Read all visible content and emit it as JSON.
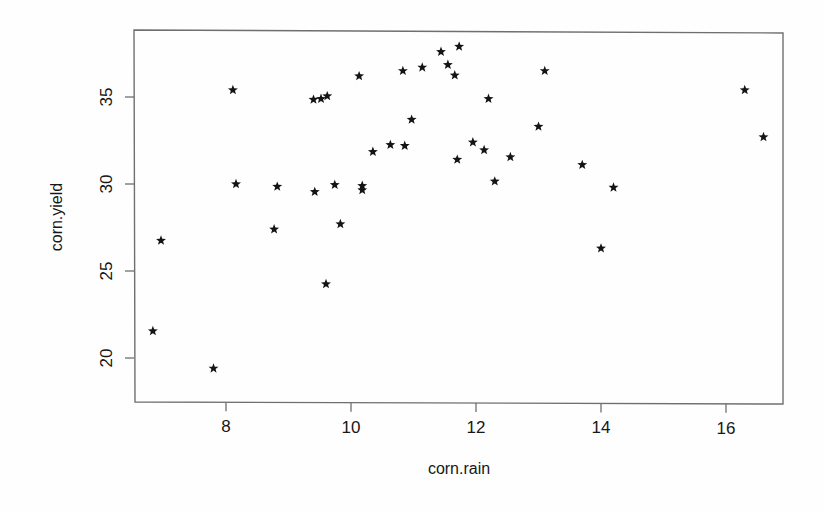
{
  "chart_data": {
    "type": "scatter",
    "title": "",
    "xlabel": "corn.rain",
    "ylabel": "corn.yield",
    "xlim": [
      6.55,
      16.95
    ],
    "ylim": [
      18.7,
      38.5
    ],
    "xticks": [
      8,
      10,
      12,
      14,
      16
    ],
    "yticks": [
      20,
      25,
      30,
      35
    ],
    "grid": false,
    "legend": null,
    "marker": "star",
    "marker_color": "#141414",
    "frame": "box",
    "points": [
      {
        "x": 6.83,
        "y": 21.55
      },
      {
        "x": 6.96,
        "y": 26.75
      },
      {
        "x": 7.8,
        "y": 19.4
      },
      {
        "x": 8.11,
        "y": 35.4
      },
      {
        "x": 8.16,
        "y": 30.0
      },
      {
        "x": 8.77,
        "y": 27.4
      },
      {
        "x": 8.82,
        "y": 29.85
      },
      {
        "x": 9.42,
        "y": 29.55
      },
      {
        "x": 9.4,
        "y": 34.85
      },
      {
        "x": 9.52,
        "y": 34.9
      },
      {
        "x": 9.62,
        "y": 35.05
      },
      {
        "x": 9.6,
        "y": 24.25
      },
      {
        "x": 9.74,
        "y": 29.95
      },
      {
        "x": 9.83,
        "y": 27.7
      },
      {
        "x": 10.13,
        "y": 36.2
      },
      {
        "x": 10.18,
        "y": 29.9
      },
      {
        "x": 10.18,
        "y": 29.65
      },
      {
        "x": 10.35,
        "y": 31.85
      },
      {
        "x": 10.63,
        "y": 32.25
      },
      {
        "x": 10.83,
        "y": 36.5
      },
      {
        "x": 10.86,
        "y": 32.2
      },
      {
        "x": 10.97,
        "y": 33.7
      },
      {
        "x": 11.14,
        "y": 36.7
      },
      {
        "x": 11.44,
        "y": 37.6
      },
      {
        "x": 11.55,
        "y": 36.85
      },
      {
        "x": 11.73,
        "y": 37.9
      },
      {
        "x": 11.66,
        "y": 36.25
      },
      {
        "x": 11.7,
        "y": 31.4
      },
      {
        "x": 11.95,
        "y": 32.4
      },
      {
        "x": 12.13,
        "y": 31.95
      },
      {
        "x": 12.2,
        "y": 34.9
      },
      {
        "x": 12.3,
        "y": 30.15
      },
      {
        "x": 12.55,
        "y": 31.55
      },
      {
        "x": 13.0,
        "y": 33.3
      },
      {
        "x": 13.1,
        "y": 36.5
      },
      {
        "x": 13.7,
        "y": 31.1
      },
      {
        "x": 14.0,
        "y": 26.3
      },
      {
        "x": 14.2,
        "y": 29.8
      },
      {
        "x": 16.3,
        "y": 35.4
      },
      {
        "x": 16.6,
        "y": 32.7
      }
    ]
  },
  "axes": {
    "x_tick_labels": [
      "8",
      "10",
      "12",
      "14",
      "16"
    ],
    "y_tick_labels": [
      "20",
      "25",
      "30",
      "35"
    ],
    "x_axis_title": "corn.rain",
    "y_axis_title": "corn.yield"
  }
}
